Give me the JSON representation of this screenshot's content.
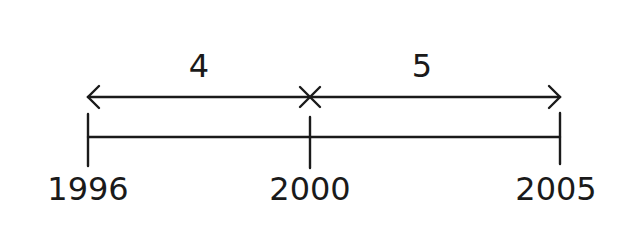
{
  "diagram": {
    "type": "number-line-timeline",
    "stroke_color": "#1a1a1a",
    "ticks": [
      {
        "label": "1996",
        "x": 88
      },
      {
        "label": "2000",
        "x": 310
      },
      {
        "label": "2005",
        "x": 560
      }
    ],
    "intervals": [
      {
        "label": "4",
        "from": "1996",
        "to": "2000"
      },
      {
        "label": "5",
        "from": "2000",
        "to": "2005"
      }
    ]
  }
}
